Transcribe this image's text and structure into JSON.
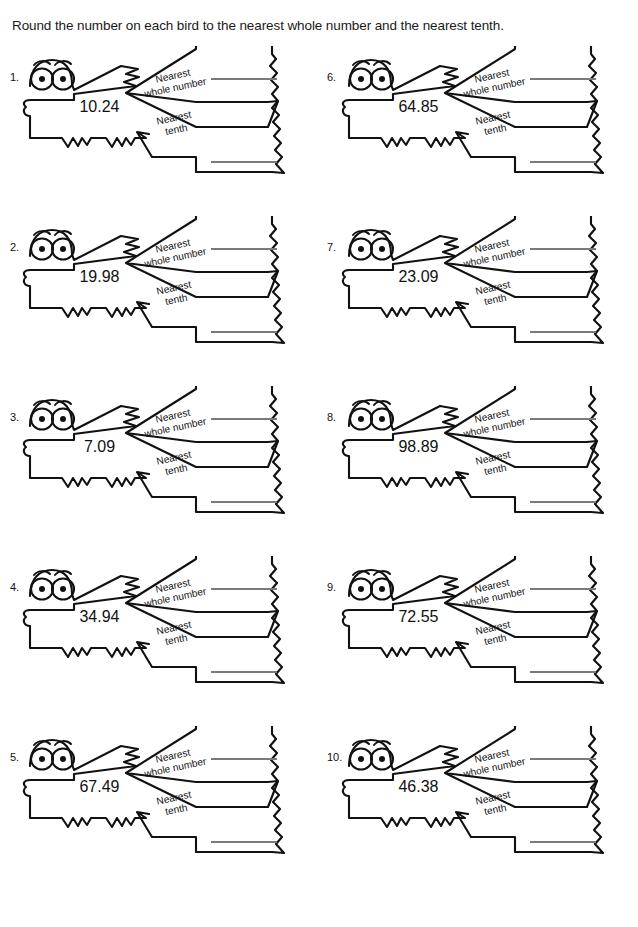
{
  "title": "Round the number on each bird to the nearest whole number and the nearest tenth.",
  "labels": {
    "nearest_whole_line1": "Nearest",
    "nearest_whole_line2": "whole number",
    "nearest_tenth_line1": "Nearest",
    "nearest_tenth_line2": "tenth"
  },
  "colors": {
    "outline": "#111111",
    "answer_line": "#7a7a7a",
    "text": "#111111",
    "background": "#ffffff"
  },
  "problems": [
    {
      "number": "1.",
      "value": "10.24",
      "whole_answer": "",
      "tenth_answer": ""
    },
    {
      "number": "6.",
      "value": "64.85",
      "whole_answer": "",
      "tenth_answer": ""
    },
    {
      "number": "2.",
      "value": "19.98",
      "whole_answer": "",
      "tenth_answer": ""
    },
    {
      "number": "7.",
      "value": "23.09",
      "whole_answer": "",
      "tenth_answer": ""
    },
    {
      "number": "3.",
      "value": "7.09",
      "whole_answer": "",
      "tenth_answer": ""
    },
    {
      "number": "8.",
      "value": "98.89",
      "whole_answer": "",
      "tenth_answer": ""
    },
    {
      "number": "4.",
      "value": "34.94",
      "whole_answer": "",
      "tenth_answer": ""
    },
    {
      "number": "9.",
      "value": "72.55",
      "whole_answer": "",
      "tenth_answer": ""
    },
    {
      "number": "5.",
      "value": "67.49",
      "whole_answer": "",
      "tenth_answer": ""
    },
    {
      "number": "10.",
      "value": "46.38",
      "whole_answer": "",
      "tenth_answer": ""
    }
  ]
}
